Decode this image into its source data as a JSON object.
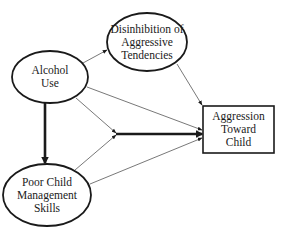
{
  "diagram": {
    "type": "path-model",
    "nodes": {
      "alcohol_use": {
        "shape": "ellipse",
        "lines": [
          "Alcohol",
          "Use"
        ],
        "cx": 50,
        "cy": 77,
        "rx": 38,
        "ry": 26
      },
      "disinhibition": {
        "shape": "ellipse",
        "lines": [
          "Disinhibition of",
          "Aggressive",
          "Tendencies"
        ],
        "cx": 147,
        "cy": 42,
        "rx": 40,
        "ry": 29
      },
      "poor_child_management": {
        "shape": "ellipse",
        "lines": [
          "Poor Child",
          "Management",
          "Skills"
        ],
        "cx": 47,
        "cy": 195,
        "rx": 44,
        "ry": 31
      },
      "aggression_toward_child": {
        "shape": "rectangle",
        "lines": [
          "Aggression",
          "Toward",
          "Child"
        ],
        "x": 203,
        "y": 106,
        "w": 71,
        "h": 47
      }
    },
    "edges": [
      {
        "from": "alcohol_use",
        "to": "disinhibition",
        "weight": "thin"
      },
      {
        "from": "disinhibition",
        "to": "aggression_toward_child",
        "weight": "thin"
      },
      {
        "from": "alcohol_use",
        "to": "aggression_toward_child",
        "weight": "thin"
      },
      {
        "from": "alcohol_use",
        "to": "interaction_point",
        "weight": "thin"
      },
      {
        "from": "poor_child_management",
        "to": "interaction_point",
        "weight": "thin"
      },
      {
        "from": "poor_child_management",
        "to": "aggression_toward_child",
        "weight": "thin"
      },
      {
        "from": "alcohol_use",
        "to": "poor_child_management",
        "weight": "thick"
      },
      {
        "from": "interaction_point",
        "to": "aggression_toward_child",
        "weight": "thick"
      }
    ],
    "colors": {
      "stroke": "#1a1a1a",
      "thin_edge": "#555555",
      "background": "#ffffff"
    }
  }
}
